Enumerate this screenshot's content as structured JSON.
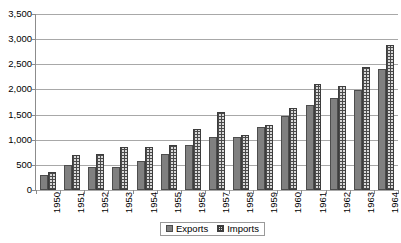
{
  "chart_data": {
    "type": "bar",
    "title": "",
    "xlabel": "",
    "ylabel": "",
    "ylim": [
      0,
      3500
    ],
    "ytick_step": 500,
    "ytick_labels": [
      "3,500",
      "3,000",
      "2,500",
      "2,000",
      "1,500",
      "1,000",
      "500",
      "0"
    ],
    "ytick_values": [
      3500,
      3000,
      2500,
      2000,
      1500,
      1000,
      500,
      0
    ],
    "grid": true,
    "legend_position": "bottom",
    "categories": [
      "1950",
      "1951",
      "1952",
      "1953",
      "1954",
      "1955",
      "1956",
      "1957",
      "1958",
      "1959",
      "1960",
      "1961",
      "1962",
      "1963",
      "1964"
    ],
    "series": [
      {
        "name": "Exports",
        "color": "#808080",
        "pattern": "solid",
        "values": [
          300,
          490,
          460,
          450,
          580,
          720,
          890,
          1050,
          1060,
          1250,
          1470,
          1700,
          1820,
          1980,
          2400
        ]
      },
      {
        "name": "Imports",
        "color": "#d9d9d9",
        "pattern": "crosshatch",
        "values": [
          350,
          700,
          720,
          860,
          860,
          890,
          1210,
          1550,
          1090,
          1300,
          1630,
          2100,
          2070,
          2440,
          2890
        ]
      }
    ]
  },
  "legend": {
    "items": [
      {
        "label": "Exports",
        "swatch": "solid-gray-square"
      },
      {
        "label": "Imports",
        "swatch": "crosshatch-square"
      }
    ]
  }
}
